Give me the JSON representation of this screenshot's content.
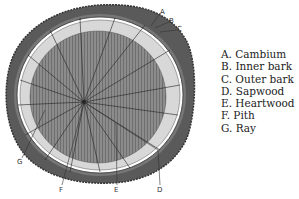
{
  "figure": {
    "callouts": [
      {
        "letter": "A",
        "x": 162,
        "y": 13
      },
      {
        "letter": "B",
        "x": 171,
        "y": 22
      },
      {
        "letter": "C",
        "x": 179,
        "y": 30
      },
      {
        "letter": "D",
        "x": 160,
        "y": 190
      },
      {
        "letter": "E",
        "x": 117,
        "y": 190
      },
      {
        "letter": "F",
        "x": 62,
        "y": 190
      },
      {
        "letter": "G",
        "x": 20,
        "y": 163
      }
    ]
  },
  "legend": {
    "items": [
      {
        "key": "A.",
        "label": "Cambium"
      },
      {
        "key": "B.",
        "label": "Inner bark"
      },
      {
        "key": "C.",
        "label": "Outer bark"
      },
      {
        "key": "D.",
        "label": "Sapwood"
      },
      {
        "key": "E.",
        "label": "Heartwood"
      },
      {
        "key": "F.",
        "label": "Pith"
      },
      {
        "key": "G.",
        "label": "Ray"
      }
    ]
  },
  "colors": {
    "bark": "#5a5a5a",
    "sapwood": "#d8d8d8",
    "heartwood": "#8a8a8a",
    "ink": "#222222"
  }
}
